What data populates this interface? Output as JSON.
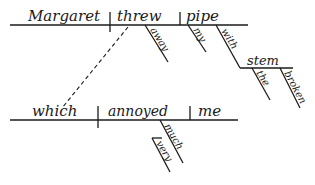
{
  "diagram": {
    "type": "sentence-diagram",
    "main_clause": {
      "subject": "Margaret",
      "verb": "threw",
      "object": "pipe",
      "verb_modifiers": [
        "away"
      ],
      "object_modifiers": [
        "my"
      ],
      "prepositional_phrase": {
        "preposition": "with",
        "object": "stem",
        "modifiers": [
          "the",
          "broken"
        ]
      }
    },
    "relative_clause": {
      "subject": "which",
      "verb": "annoyed",
      "object": "me",
      "verb_modifiers": [
        "much"
      ],
      "modifier_of_modifier": "very"
    },
    "colors": {
      "ink": "#1a1a1a",
      "background": "#ffffff"
    }
  }
}
